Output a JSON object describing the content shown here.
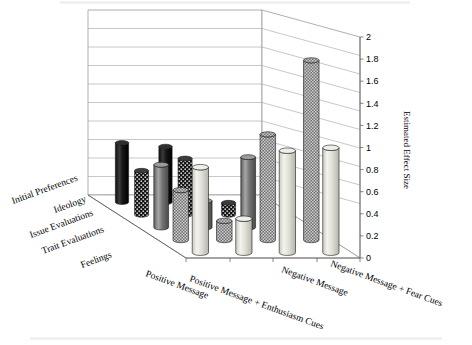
{
  "figure": {
    "top_cut_text": "",
    "bottom_caption_text": ""
  },
  "axes": {
    "value_axis_title": "Estimated Effect Size",
    "value_ticks": [
      "0",
      "0.2",
      "0.4",
      "0.6",
      "0.8",
      "1",
      "1.2",
      "1.4",
      "1.6",
      "1.8",
      "2"
    ],
    "depth_categories": [
      "Initial Preferences",
      "Ideology",
      "Issue Evaluations",
      "Trait Evaluations",
      "Feelings"
    ],
    "x_categories": [
      "Positive Message",
      "Positive Message + Enthusiasm Cues",
      "Negative Message",
      "Negative Message + Fear Cues"
    ]
  },
  "chart_data": {
    "type": "bar",
    "title": "",
    "xlabel": "",
    "ylabel": "Estimated Effect Size",
    "ylim": [
      0,
      2
    ],
    "ytick_step": 0.2,
    "grid": true,
    "legend": "none",
    "projection": "3d-cylinder",
    "categories": [
      "Positive Message",
      "Positive Message + Enthusiasm Cues",
      "Negative Message",
      "Negative Message + Fear Cues"
    ],
    "series": [
      {
        "name": "Initial Preferences",
        "fill": "#1c1c1c",
        "pattern": "solid-dark",
        "values": [
          0.64,
          0.6,
          0.0,
          0.0
        ]
      },
      {
        "name": "Ideology",
        "fill": "#2a2a2a",
        "pattern": "dotted-dark",
        "values": [
          0.47,
          0.6,
          0.13,
          0.0
        ]
      },
      {
        "name": "Issue Evaluations",
        "fill": "#7a7a7a",
        "pattern": "solid-mid",
        "values": [
          0.66,
          0.28,
          0.74,
          0.0
        ]
      },
      {
        "name": "Trait Evaluations",
        "fill": "#6e6e6e",
        "pattern": "checker-mid",
        "values": [
          0.52,
          0.2,
          1.1,
          1.87
        ]
      },
      {
        "name": "Feelings",
        "fill": "#e4e4dc",
        "pattern": "solid-light",
        "values": [
          0.88,
          0.35,
          1.05,
          1.08
        ]
      }
    ]
  }
}
